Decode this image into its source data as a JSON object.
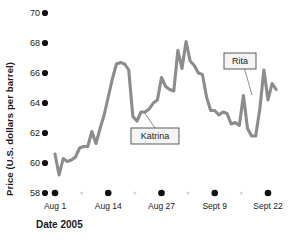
{
  "chart_data": {
    "type": "line",
    "title": "",
    "xlabel": "Date 2005",
    "ylabel": "Price (U.S. dollars per barrel)",
    "ylim": [
      58,
      70
    ],
    "yticks": [
      58,
      60,
      62,
      64,
      66,
      68,
      70
    ],
    "ytick_labels": [
      "58",
      "60",
      "62",
      "64",
      "66",
      "68",
      "70"
    ],
    "xtick_labels": [
      "Aug 1",
      "Aug 14",
      "Aug 27",
      "Sept 9",
      "Sept 22"
    ],
    "xtick_days": [
      0,
      13,
      26,
      39,
      52
    ],
    "xlim_days": [
      -1,
      55
    ],
    "grid": false,
    "legend": null,
    "series_name": "Crude oil price",
    "line_color": "#8c8c8c",
    "x": [
      0,
      1,
      2,
      3,
      4,
      5,
      6,
      7,
      8,
      9,
      10,
      11,
      12,
      13,
      14,
      15,
      16,
      17,
      18,
      19,
      20,
      21,
      22,
      23,
      24,
      25,
      26,
      27,
      28,
      29,
      30,
      31,
      32,
      33,
      34,
      35,
      36,
      37,
      38,
      39,
      40,
      41,
      42,
      43,
      44,
      45,
      46,
      47,
      48,
      49,
      50,
      51,
      52,
      53,
      54
    ],
    "values": [
      60.6,
      59.2,
      60.3,
      60.1,
      60.2,
      60.4,
      61.0,
      61.1,
      61.1,
      62.1,
      61.3,
      62.3,
      63.2,
      64.4,
      65.6,
      66.6,
      66.7,
      66.6,
      66.2,
      63.1,
      62.8,
      63.4,
      63.4,
      63.6,
      64.0,
      64.2,
      65.7,
      65.1,
      64.9,
      64.8,
      67.5,
      66.3,
      68.1,
      66.8,
      66.5,
      66.0,
      65.9,
      64.4,
      63.5,
      63.5,
      63.2,
      63.4,
      63.3,
      62.6,
      62.7,
      62.5,
      64.5,
      62.3,
      61.8,
      61.8,
      63.6,
      66.2,
      64.2,
      65.3,
      64.9
    ],
    "annotations": [
      {
        "label": "Katrina",
        "x_day": 28.5,
        "y_value": 62.6,
        "box_x": 131,
        "box_y": 128,
        "box_w": 48,
        "box_h": 16,
        "leader_to_x": 144,
        "leader_to_y": 112
      },
      {
        "label": "Rita",
        "x_day": 50.0,
        "y_value": 67.6,
        "box_x": 224,
        "box_y": 53,
        "box_w": 32,
        "box_h": 16,
        "leader_to_x": 252,
        "leader_to_y": 95
      }
    ]
  },
  "axis": {
    "y_title": "Price (U.S. dollars per barrel)",
    "x_title": "Date 2005"
  }
}
